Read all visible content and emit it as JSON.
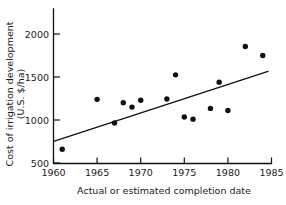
{
  "chart_data": {
    "type": "scatter",
    "title": "",
    "xlabel": "Actual or estimated completion date",
    "ylabel": "Cost of irrigation development (U.S. $/ha)",
    "ylabel_line1": "Cost of irrigation development",
    "ylabel_line2": "(U.S. $/ha)",
    "xlim": [
      1960,
      1985
    ],
    "ylim": [
      500,
      2100
    ],
    "xticks": [
      1960,
      1965,
      1970,
      1975,
      1980,
      1985
    ],
    "xtick_labels": [
      "1960",
      "1965",
      "1970",
      "1975",
      "1980",
      "1985"
    ],
    "yticks": [
      500,
      1000,
      1500,
      2000
    ],
    "ytick_labels": [
      "500",
      "1000",
      "1500",
      "2000"
    ],
    "grid": false,
    "legend": false,
    "marker": "filled-circle",
    "marker_color": "#111111",
    "line_color": "#111111",
    "x": [
      1961,
      1965,
      1967,
      1968,
      1969,
      1970,
      1973,
      1974,
      1975,
      1976,
      1978,
      1979,
      1980,
      1982,
      1984
    ],
    "y": [
      660,
      1240,
      965,
      1200,
      1150,
      1230,
      1245,
      1525,
      1035,
      1010,
      1135,
      1440,
      1110,
      1855,
      1750
    ],
    "points": [
      {
        "x": 1961,
        "y": 660
      },
      {
        "x": 1965,
        "y": 1240
      },
      {
        "x": 1967,
        "y": 965
      },
      {
        "x": 1968,
        "y": 1200
      },
      {
        "x": 1969,
        "y": 1150
      },
      {
        "x": 1970,
        "y": 1230
      },
      {
        "x": 1973,
        "y": 1245
      },
      {
        "x": 1974,
        "y": 1525
      },
      {
        "x": 1975,
        "y": 1035
      },
      {
        "x": 1976,
        "y": 1010
      },
      {
        "x": 1978,
        "y": 1135
      },
      {
        "x": 1979,
        "y": 1440
      },
      {
        "x": 1980,
        "y": 1110
      },
      {
        "x": 1982,
        "y": 1855
      },
      {
        "x": 1984,
        "y": 1750
      }
    ],
    "trend_line": {
      "x_start": 1960.1,
      "y_start": 755,
      "x_end": 1984.6,
      "y_end": 1565
    }
  }
}
